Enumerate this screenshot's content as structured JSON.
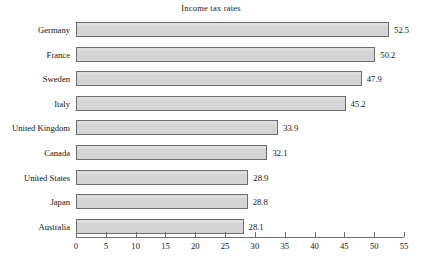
{
  "chart_data": {
    "type": "bar",
    "orientation": "horizontal",
    "title": "Income tax rates",
    "xlabel": "",
    "ylabel": "",
    "xlim": [
      0,
      55
    ],
    "xticks": [
      "0",
      "5",
      "10",
      "15",
      "20",
      "25",
      "30",
      "35",
      "40",
      "45",
      "50",
      "55"
    ],
    "grid": false,
    "legend": "none",
    "categories": [
      "Germany",
      "France",
      "Sweden",
      "Italy",
      "United Kingdom",
      "Canada",
      "United States",
      "Japan",
      "Australia"
    ],
    "values": [
      52.5,
      50.2,
      47.9,
      45.2,
      33.9,
      32.1,
      28.9,
      28.8,
      28.1
    ],
    "value_labels": [
      "52.5",
      "50.2",
      "47.9",
      "45.2",
      "33.9",
      "32.1",
      "28.9",
      "28.8",
      "28.1"
    ],
    "bar_color": "#d4d4d4",
    "bar_edge_color": "#6d6d6d",
    "background_color": "#ffffff",
    "text_color": "#141414"
  }
}
